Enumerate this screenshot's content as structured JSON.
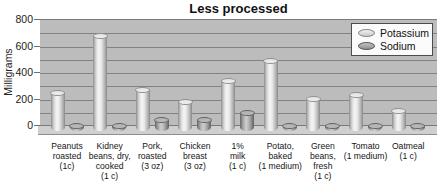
{
  "chart_data": {
    "type": "bar",
    "style": "3d-cylinder",
    "title": "Less processed",
    "xlabel": "",
    "ylabel": "Milligrams",
    "ylim": [
      0,
      800
    ],
    "yticks": [
      800,
      600,
      400,
      200,
      0
    ],
    "gridline_interval": 100,
    "grid": "on",
    "legend_position": "top-right",
    "categories": [
      "Peanuts roasted (1c)",
      "Kidney beans, dry, cooked (1 c)",
      "Pork, roasted (3 oz)",
      "Chicken breast (3 oz)",
      "1% milk (1 c)",
      "Potato, baked (1 medium)",
      "Green beans, fresh (1 c)",
      "Tomato (1 medium)",
      "Oatmeal (1 c)"
    ],
    "categories_display": [
      "Peanuts\nroasted\n(1c)",
      "Kidney\nbeans, dry,\ncooked\n(1 c)",
      "Pork,\nroasted\n(3 oz)",
      "Chicken\nbreast\n(3 oz)",
      "1%\nmilk\n(1 c)",
      "Potato,\nbaked\n(1 medium)",
      "Green\nbeans,\nfresh\n(1 c)",
      "Tomato\n(1 medium)",
      "Oatmeal\n(1 c)"
    ],
    "series": [
      {
        "name": "Potassium",
        "values": [
          260,
          690,
          280,
          185,
          350,
          500,
          215,
          245,
          120
        ]
      },
      {
        "name": "Sodium",
        "values": [
          10,
          10,
          50,
          55,
          105,
          10,
          5,
          10,
          5
        ]
      }
    ],
    "colors": {
      "wall": "#bcbcbc",
      "gridline": "#828282",
      "floor": "#cfcfcf",
      "potassium_bar": "#e6e6e6",
      "sodium_bar": "#9e9e9e",
      "legend_background": "#fbfbfb",
      "text": "#111111"
    }
  }
}
